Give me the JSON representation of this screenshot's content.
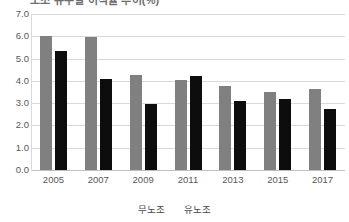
{
  "chart_data": {
    "type": "bar",
    "title": "",
    "xlabel": "",
    "ylabel": "",
    "categories": [
      "2005",
      "2007",
      "2009",
      "2011",
      "2013",
      "2015",
      "2017"
    ],
    "series": [
      {
        "name": "무노조",
        "color": "#808080",
        "values": [
          6.0,
          5.95,
          4.25,
          4.05,
          3.75,
          3.5,
          3.65
        ]
      },
      {
        "name": "유노조",
        "color": "#0d0d0d",
        "values": [
          5.35,
          4.1,
          2.95,
          4.2,
          3.1,
          3.2,
          2.75
        ]
      }
    ],
    "ylim": [
      0.0,
      7.0
    ],
    "ytick_step": 1.0,
    "yticks": [
      "7.0",
      "6.0",
      "5.0",
      "4.0",
      "3.0",
      "2.0",
      "1.0",
      "0.0"
    ],
    "ytick_values": [
      7.0,
      6.0,
      5.0,
      4.0,
      3.0,
      2.0,
      1.0,
      0.0
    ],
    "grid": true,
    "legend_position": "bottom"
  },
  "legend": {
    "items": [
      {
        "label": "무노조"
      },
      {
        "label": "유노조"
      }
    ]
  },
  "title_strip": {
    "text": "노조 유무별 이직률 추이(%)"
  }
}
